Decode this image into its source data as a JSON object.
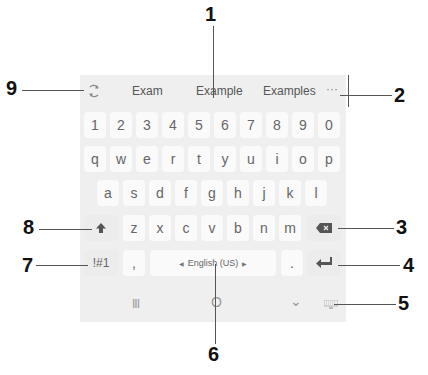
{
  "suggestion_bar": {
    "suggestions": [
      "Exam",
      "Example",
      "Examples"
    ],
    "more_label": "···"
  },
  "keyboard": {
    "row_numbers": [
      "1",
      "2",
      "3",
      "4",
      "5",
      "6",
      "7",
      "8",
      "9",
      "0"
    ],
    "row_top": [
      "q",
      "w",
      "e",
      "r",
      "t",
      "y",
      "u",
      "i",
      "o",
      "p"
    ],
    "row_middle": [
      "a",
      "s",
      "d",
      "f",
      "g",
      "h",
      "j",
      "k",
      "l"
    ],
    "row_bottom": [
      "z",
      "x",
      "c",
      "v",
      "b",
      "n",
      "m"
    ],
    "symbols_label": "!#1",
    "comma_label": ",",
    "space_label": "English (US)",
    "period_label": ".",
    "icons": {
      "mode": "rotate-icon",
      "shift": "shift-arrow-icon",
      "backspace": "backspace-icon",
      "enter": "enter-icon",
      "keyboard_switch": "keyboard-icon"
    }
  },
  "navigation_bar": {
    "recents_label": "III",
    "home_label": "O",
    "back_label": "⌄"
  },
  "callouts": {
    "1": "1",
    "2": "2",
    "3": "3",
    "4": "4",
    "5": "5",
    "6": "6",
    "7": "7",
    "8": "8",
    "9": "9"
  },
  "colors": {
    "panel_bg": "#efefef",
    "key_bg": "#fafafa",
    "key_text": "#666666",
    "callout": "#111111"
  }
}
